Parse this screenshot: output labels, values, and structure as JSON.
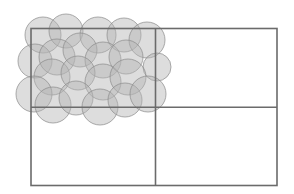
{
  "diagram": {
    "grid": {
      "rows": 2,
      "columns": 2
    },
    "colors": {
      "grid_line": "#6b6b6b",
      "circle_fill": "#b4b4b4",
      "circle_stroke": "#8a8a8a",
      "background": "#ffffff"
    },
    "circle_count": 21,
    "covered_cell": "top-left"
  }
}
